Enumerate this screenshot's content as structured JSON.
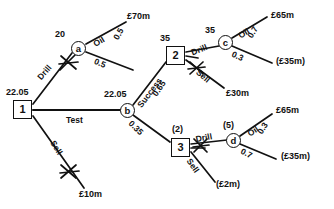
{
  "diagram": {
    "type": "decision-tree",
    "currency_unit": "£m",
    "nodes": [
      {
        "id": "1",
        "kind": "decision",
        "label": "1",
        "value": "22.05",
        "x": 22,
        "y": 110
      },
      {
        "id": "a",
        "kind": "chance",
        "label": "a",
        "value": "20",
        "x": 78,
        "y": 48
      },
      {
        "id": "b",
        "kind": "chance",
        "label": "b",
        "value": "22.05",
        "x": 127,
        "y": 110
      },
      {
        "id": "2",
        "kind": "decision",
        "label": "2",
        "value": "35",
        "x": 175,
        "y": 55
      },
      {
        "id": "c",
        "kind": "chance",
        "label": "c",
        "value": "35",
        "x": 225,
        "y": 42
      },
      {
        "id": "3",
        "kind": "decision",
        "label": "3",
        "value": "(2)",
        "x": 180,
        "y": 147
      },
      {
        "id": "d",
        "kind": "chance",
        "label": "d",
        "value": "(5)",
        "x": 233,
        "y": 140
      }
    ],
    "node_values": {
      "n1": "22.05",
      "na": "20",
      "nb": "22.05",
      "n2": "35",
      "nc": "35",
      "n3": "(2)",
      "nd": "(5)"
    },
    "branch_labels": {
      "drill_from_1": "Drill",
      "test_from_1": "Test",
      "sell_from_1": "Sell",
      "oil_from_a": "Oil",
      "success_from_b": "Success",
      "drill_from_2": "Drill",
      "sell_from_2": "Sell",
      "oil_from_c": "Oil",
      "drill_from_3": "Drill",
      "sell_from_3": "Sell",
      "oil_from_d": "Oil"
    },
    "probabilities": {
      "a_oil": "0.5",
      "a_dry": "0.5",
      "b_success": "0.65",
      "b_fail": "0.35",
      "c_oil": "0.7",
      "c_dry": "0.3",
      "d_oil": "0.3",
      "d_dry": "0.7"
    },
    "payoffs": {
      "a_oil": "£70m",
      "sell_1": "£10m",
      "c_oil": "£65m",
      "c_dry": "(£35m)",
      "sell_2": "£30m",
      "d_oil": "£65m",
      "d_dry": "(£35m)",
      "sell_3": "(£2m)"
    },
    "pruned_branches": [
      "drill_from_1",
      "sell_from_2",
      "drill_from_3"
    ]
  }
}
